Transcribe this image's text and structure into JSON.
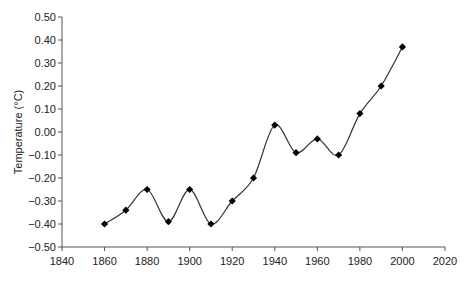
{
  "chart_data": {
    "type": "line",
    "title": "",
    "xlabel": "",
    "ylabel": "Temperature (°C)",
    "xlim": [
      1840,
      2020
    ],
    "ylim": [
      -0.5,
      0.5
    ],
    "x_ticks": [
      1840,
      1860,
      1880,
      1900,
      1920,
      1940,
      1960,
      1980,
      2000,
      2020
    ],
    "x_tick_labels": [
      "1840",
      "1860",
      "1880",
      "1900",
      "1920",
      "1940",
      "1960",
      "1980",
      "2000",
      "2020"
    ],
    "y_ticks": [
      0.5,
      0.4,
      0.3,
      0.2,
      0.1,
      0.0,
      -0.1,
      -0.2,
      -0.3,
      -0.4,
      -0.5
    ],
    "y_tick_labels": [
      "0.50",
      "0.40",
      "0.30",
      "0.20",
      "0.10",
      "0.00",
      "−0.10",
      "−0.20",
      "−0.30",
      "−0.40",
      "−0.50"
    ],
    "grid": false,
    "legend": null,
    "line_style": "smoothed",
    "marker": "diamond",
    "series": [
      {
        "name": "Temperature",
        "color": "#000000",
        "x": [
          1860,
          1870,
          1880,
          1890,
          1900,
          1910,
          1920,
          1930,
          1940,
          1950,
          1960,
          1970,
          1980,
          1990,
          2000
        ],
        "values": [
          -0.4,
          -0.34,
          -0.25,
          -0.39,
          -0.25,
          -0.4,
          -0.3,
          -0.2,
          0.03,
          -0.09,
          -0.03,
          -0.1,
          0.08,
          0.2,
          0.37
        ]
      }
    ]
  },
  "layout": {
    "plot_left": 62,
    "plot_right": 445,
    "plot_top": 17,
    "plot_bottom": 247
  }
}
